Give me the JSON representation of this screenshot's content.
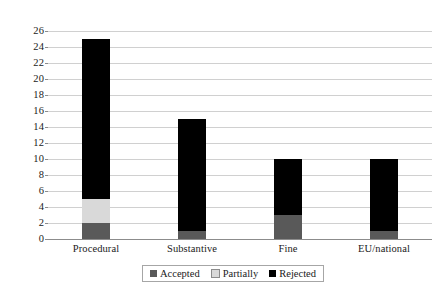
{
  "chart_data": {
    "type": "bar",
    "subtype": "stacked-column",
    "title": "",
    "xlabel": "",
    "ylabel": "",
    "ylim": [
      0,
      26
    ],
    "ytick_step": 2,
    "yticks": [
      26,
      24,
      22,
      20,
      18,
      16,
      14,
      12,
      10,
      8,
      6,
      4,
      2,
      0
    ],
    "grid": true,
    "legend_position": "bottom",
    "categories": [
      "Procedural",
      "Substantive",
      "Fine",
      "EU/national"
    ],
    "series": [
      {
        "name": "Accepted",
        "color": "#595959",
        "values": [
          2,
          1,
          3,
          1
        ]
      },
      {
        "name": "Partially",
        "color": "#d9d9d9",
        "values": [
          3,
          0,
          0,
          0
        ]
      },
      {
        "name": "Rejected",
        "color": "#000000",
        "values": [
          20,
          14,
          7,
          9
        ]
      }
    ],
    "totals": [
      25,
      15,
      10,
      10
    ]
  },
  "legend": {
    "items": [
      {
        "label": "Accepted",
        "color": "#595959"
      },
      {
        "label": "Partially",
        "color": "#d9d9d9"
      },
      {
        "label": "Rejected",
        "color": "#000000"
      }
    ]
  },
  "colors": {
    "accepted": "#595959",
    "partially": "#d9d9d9",
    "rejected": "#000000",
    "gridline": "#d0d0d0",
    "axis": "#8c8c8c",
    "background": "#ffffff"
  }
}
